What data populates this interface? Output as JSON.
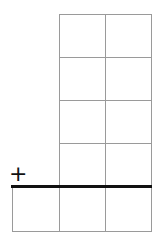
{
  "diagram": {
    "type": "subtraction-grid",
    "operator_symbol": "+",
    "upper_grid": {
      "rows": 4,
      "cols": 2
    },
    "lower_row": {
      "cols": 3
    },
    "colors": {
      "grid_line": "#9a9a9a",
      "sum_line": "#111111",
      "background": "#ffffff"
    }
  }
}
